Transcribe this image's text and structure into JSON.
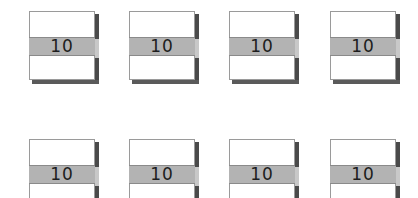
{
  "tiles": [
    {
      "label": "10",
      "x": 29,
      "y": 11
    },
    {
      "label": "10",
      "x": 129,
      "y": 11
    },
    {
      "label": "10",
      "x": 229,
      "y": 11
    },
    {
      "label": "10",
      "x": 330,
      "y": 11
    },
    {
      "label": "10",
      "x": 29,
      "y": 139
    },
    {
      "label": "10",
      "x": 129,
      "y": 139
    },
    {
      "label": "10",
      "x": 229,
      "y": 139
    },
    {
      "label": "10",
      "x": 330,
      "y": 139
    }
  ],
  "layout": {
    "band_offset": 26
  },
  "colors": {
    "face": "#ffffff",
    "band": "#b3b3b3",
    "shadow": "#4a4a4a",
    "text": "#1e1e1e"
  }
}
